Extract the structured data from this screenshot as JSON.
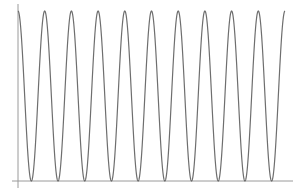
{
  "chart_data": {
    "type": "line",
    "title": "",
    "xlabel": "",
    "ylabel": "",
    "function_shape": "periodic oscillation, cosine-like, starting at a maximum",
    "periods": 10,
    "x_range": [
      0,
      10
    ],
    "ylim": [
      0,
      1
    ],
    "grid": false,
    "legend": null,
    "tick_labels": {
      "x": [],
      "y": []
    },
    "series": [
      {
        "name": "oscillation",
        "color": "#707070",
        "x": [
          0,
          0.5,
          1,
          1.5,
          2,
          2.5,
          3,
          3.5,
          4,
          4.5,
          5,
          5.5,
          6,
          6.5,
          7,
          7.5,
          8,
          8.5,
          9,
          9.5,
          10
        ],
        "values": [
          1,
          0,
          1,
          0,
          1,
          0,
          1,
          0,
          1,
          0,
          1,
          0,
          1,
          0,
          1,
          0,
          1,
          0,
          1,
          0,
          1
        ]
      }
    ]
  },
  "style": {
    "axis_color": "#9a9a9a",
    "line_color": "#6e6e6e",
    "background": "#ffffff"
  }
}
